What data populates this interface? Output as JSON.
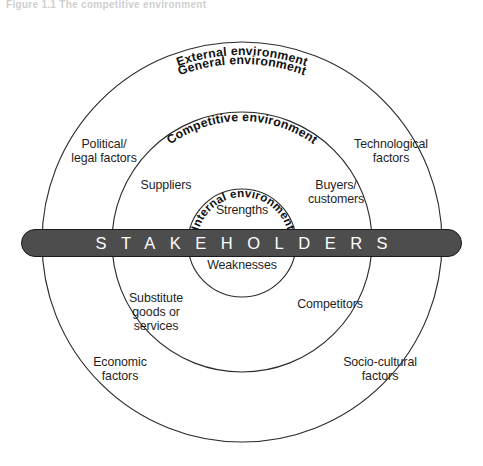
{
  "figure": {
    "caption_partial": "Figure 1.1  The competitive environment"
  },
  "rings": [
    {
      "id": "external",
      "label": "External environment"
    },
    {
      "id": "general",
      "label": "General environment"
    },
    {
      "id": "competitive",
      "label": "Competitive environment"
    },
    {
      "id": "internal",
      "label": "Internal environment"
    }
  ],
  "bar": {
    "label": "STAKEHOLDERS",
    "fill_color": "#4d4d4d",
    "text_color": "#ffffff",
    "border_color": "#1a1a1a"
  },
  "internal_items": [
    {
      "id": "strengths",
      "label": "Strengths"
    },
    {
      "id": "weaknesses",
      "label": "Weaknesses"
    }
  ],
  "competitive_items": [
    {
      "id": "suppliers",
      "label": "Suppliers"
    },
    {
      "id": "buyers-customers",
      "label": "Buyers/\ncustomers"
    },
    {
      "id": "competitors",
      "label": "Competitors"
    },
    {
      "id": "substitutes",
      "label": "Substitute\ngoods or\nservices"
    }
  ],
  "general_items": [
    {
      "id": "political-legal",
      "label": "Political/\nlegal factors"
    },
    {
      "id": "technological",
      "label": "Technological\nfactors"
    },
    {
      "id": "economic",
      "label": "Economic\nfactors"
    },
    {
      "id": "socio-cultural",
      "label": "Socio-cultural\nfactors"
    }
  ],
  "colors": {
    "stroke": "#2b2b2b",
    "text": "#1f1f1f",
    "background": "#ffffff"
  }
}
